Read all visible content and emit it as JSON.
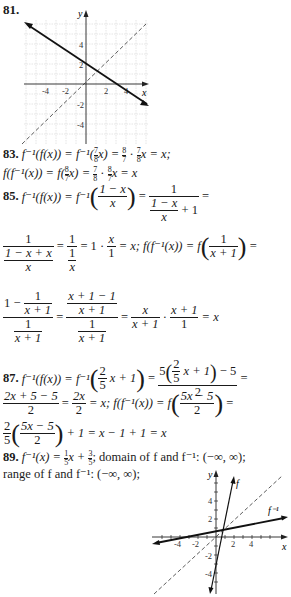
{
  "problems": {
    "p81": {
      "number": "81.",
      "graph": {
        "axis_labels": {
          "x": "x",
          "y": "y"
        },
        "x_ticks": [
          "-4",
          "-2",
          "2",
          "4"
        ],
        "y_ticks": [
          "4",
          "2",
          "-2",
          "-4"
        ],
        "solid_line": {
          "description": "decreasing line, y-intercept ≈ 2.5, x-intercept ≈ 3.5"
        },
        "dashed_line": {
          "description": "y = x"
        }
      }
    },
    "p83": {
      "number": "83.",
      "line1": {
        "lhs": "f⁻¹(f(x)) = f⁻¹(",
        "frac_in": {
          "num": "7",
          "den": "8"
        },
        "mid": "x) = ",
        "frac_a": {
          "num": "8",
          "den": "7"
        },
        "dot": " · ",
        "frac_b": {
          "num": "7",
          "den": "8"
        },
        "end": "x = x;"
      },
      "line2": {
        "lhs": "f(f⁻¹(x)) = f(",
        "frac_in": {
          "num": "8",
          "den": "7"
        },
        "mid": "x) = ",
        "frac_a": {
          "num": "7",
          "den": "8"
        },
        "dot": " · ",
        "frac_b": {
          "num": "8",
          "den": "7"
        },
        "end": "x = x"
      }
    },
    "p85": {
      "number": "85.",
      "line1_lhs": "f⁻¹(f(x)) = f⁻¹",
      "frac1": {
        "num": "1 − x",
        "den": "x"
      },
      "eq": "=",
      "frac2_num": "1",
      "frac2_den_top": "1 − x",
      "frac2_den_bottom": "x",
      "frac2_den_tail": "+ 1",
      "line2": {
        "f1_num": "1",
        "f1_den_top": "1 − x + x",
        "f1_den_bot": "x",
        "f2_num": "1",
        "f2_den_top": "1",
        "f2_den_bot": "x",
        "mid": "= 1 ·",
        "f3": {
          "num": "x",
          "den": "1"
        },
        "tail": "= x; f(f⁻¹(x)) = f",
        "f4": {
          "num": "1",
          "den": "x + 1"
        }
      },
      "line3": {
        "a_top_lead": "1 −",
        "a_top_frac": {
          "num": "1",
          "den": "x + 1"
        },
        "a_bot": {
          "num": "1",
          "den": "x + 1"
        },
        "b_top": {
          "num": "x + 1 − 1",
          "den": "x + 1"
        },
        "b_bot": {
          "num": "1",
          "den": "x + 1"
        },
        "c": {
          "num": "x",
          "den": "x + 1"
        },
        "dot": "·",
        "d": {
          "num": "x + 1",
          "den": "1"
        },
        "end": "= x"
      }
    },
    "p87": {
      "number": "87.",
      "line1_lhs": "f⁻¹(f(x)) = f⁻¹",
      "inner_frac": {
        "num": "2",
        "den": "5"
      },
      "inner_tail": "x + 1",
      "rhs_num_lead": "5",
      "rhs_num_tail": "x + 1",
      "rhs_num_end": "− 5",
      "rhs_den": "2",
      "line2": {
        "f1": {
          "num": "2x + 5 − 5",
          "den": "2"
        },
        "f2": {
          "num": "2x",
          "den": "2"
        },
        "mid": "= x; f(f⁻¹(x)) = f",
        "f3": {
          "num": "5x − 5",
          "den": "2"
        }
      },
      "line3": {
        "f1": {
          "num": "2",
          "den": "5"
        },
        "f2": {
          "num": "5x − 5",
          "den": "2"
        },
        "end": "+ 1 = x − 1 + 1 = x"
      }
    },
    "p89": {
      "number": "89.",
      "line1_a": "f⁻¹(x) = ",
      "frac_a": {
        "num": "1",
        "den": "5"
      },
      "line1_b": "x + ",
      "frac_b": {
        "num": "3",
        "den": "5"
      },
      "line1_c": "; domain of f and f⁻¹: (−∞, ∞);",
      "line2": "range of f and f⁻¹: (−∞, ∞);",
      "graph": {
        "axis_labels": {
          "x": "x",
          "y": "y"
        },
        "x_ticks": [
          "-4",
          "-2",
          "2",
          "4"
        ],
        "y_ticks": [
          "4",
          "2",
          "-2",
          "-4"
        ],
        "curve_labels": {
          "f": "f",
          "finv": "f⁻¹"
        }
      }
    }
  }
}
